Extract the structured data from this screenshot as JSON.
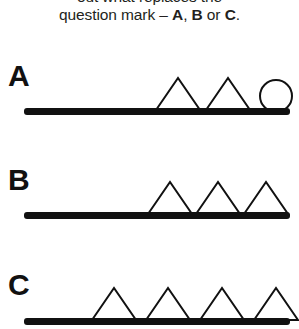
{
  "prompt": {
    "line1": "out what replaces the",
    "line2_pre": "question mark ",
    "line2_dash": "– ",
    "line2_a": "A",
    "line2_comma": ", ",
    "line2_b": "B",
    "line2_or": " or ",
    "line2_c": "C",
    "line2_period": "."
  },
  "colors": {
    "ink": "#231f20",
    "stroke": "#111111",
    "background": "#ffffff"
  },
  "options": [
    {
      "label": "A",
      "name": "option-a",
      "bar": {
        "x": 24,
        "y": 50,
        "width": 266,
        "height": 7
      },
      "shapes": [
        {
          "kind": "triangle",
          "name": "triangle",
          "cx": 178,
          "base_y": 52,
          "half_width": 22,
          "height": 32
        },
        {
          "kind": "triangle",
          "name": "triangle",
          "cx": 228,
          "base_y": 52,
          "half_width": 22,
          "height": 32
        },
        {
          "kind": "circle",
          "name": "circle",
          "cx": 276,
          "cy": 38,
          "r": 16
        }
      ]
    },
    {
      "label": "B",
      "name": "option-b",
      "bar": {
        "x": 24,
        "y": 50,
        "width": 266,
        "height": 7
      },
      "shapes": [
        {
          "kind": "triangle",
          "name": "triangle",
          "cx": 170,
          "base_y": 52,
          "half_width": 22,
          "height": 32
        },
        {
          "kind": "triangle",
          "name": "triangle",
          "cx": 218,
          "base_y": 52,
          "half_width": 22,
          "height": 32
        },
        {
          "kind": "triangle",
          "name": "triangle",
          "cx": 266,
          "base_y": 52,
          "half_width": 22,
          "height": 32
        }
      ]
    },
    {
      "label": "C",
      "name": "option-c",
      "bar": {
        "x": 24,
        "y": 52,
        "width": 266,
        "height": 7
      },
      "shapes": [
        {
          "kind": "triangle",
          "name": "triangle",
          "cx": 114,
          "base_y": 54,
          "half_width": 22,
          "height": 32
        },
        {
          "kind": "triangle",
          "name": "triangle",
          "cx": 168,
          "base_y": 54,
          "half_width": 22,
          "height": 32
        },
        {
          "kind": "triangle",
          "name": "triangle",
          "cx": 222,
          "base_y": 54,
          "half_width": 22,
          "height": 32
        },
        {
          "kind": "triangle",
          "name": "triangle",
          "cx": 276,
          "base_y": 54,
          "half_width": 22,
          "height": 32
        }
      ]
    }
  ]
}
